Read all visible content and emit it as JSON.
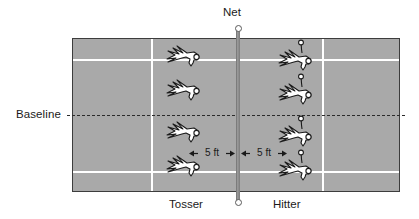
{
  "diagram": {
    "net_label": "Net",
    "baseline_label": "Baseline",
    "tosser_label": "Tosser",
    "hitter_label": "Hitter",
    "spacing_left": "5 ft",
    "spacing_right": "5 ft",
    "colors": {
      "court_surface": "#a9a9a9",
      "court_border": "#3d3d3d",
      "court_lines": "#ffffff",
      "baseline_dash": "#2b2b2b",
      "net": "#7a7a7a",
      "figure_fill": "#ffffff",
      "figure_stroke": "#1a1a1a",
      "text": "#1a1a1a",
      "background": "#ffffff"
    },
    "tosser_positions": [
      {
        "index": 1,
        "x": 168,
        "y": 46
      },
      {
        "index": 2,
        "x": 168,
        "y": 80
      },
      {
        "index": 3,
        "x": 168,
        "y": 122
      },
      {
        "index": 4,
        "x": 168,
        "y": 156
      }
    ],
    "hitter_positions": [
      {
        "index": 1,
        "x": 280,
        "y": 42
      },
      {
        "index": 2,
        "x": 280,
        "y": 76
      },
      {
        "index": 3,
        "x": 280,
        "y": 118
      },
      {
        "index": 4,
        "x": 280,
        "y": 152
      }
    ],
    "icons": {
      "player": "player-top-view-icon",
      "ball": "tennis-ball-icon",
      "net_post": "net-post-icon",
      "arrow_left": "arrow-left-icon",
      "arrow_right": "arrow-right-icon"
    }
  }
}
